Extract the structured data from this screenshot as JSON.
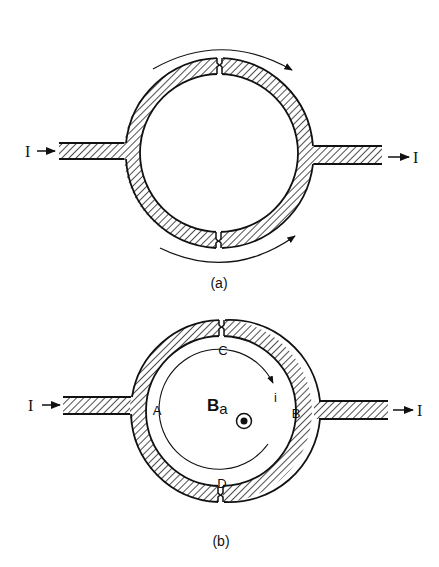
{
  "figure": {
    "colors": {
      "ink": "#111111",
      "background": "#ffffff"
    }
  },
  "panel_a": {
    "caption": "(a)",
    "input_current_label": "I",
    "output_current_label": "I",
    "upper_arrow": "current-direction-upper-arc",
    "lower_arrow": "current-direction-lower-arc",
    "junctions": [
      "top-junction",
      "bottom-junction"
    ]
  },
  "panel_b": {
    "caption": "(b)",
    "input_current_label": "I",
    "output_current_label": "I",
    "point_labels": {
      "A": "A",
      "B": "B",
      "C": "C",
      "D": "D"
    },
    "field_label": {
      "main": "B",
      "subscript": "a"
    },
    "circulating_current_label": "i",
    "field_symbol": "out-of-page-dot",
    "junctions": [
      "top-junction-C",
      "bottom-junction-D"
    ]
  }
}
